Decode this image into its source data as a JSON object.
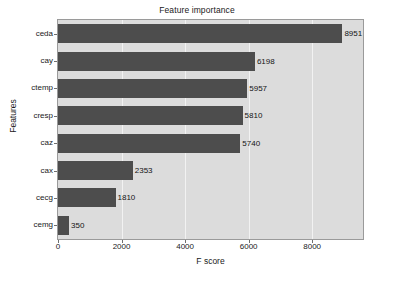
{
  "chart_data": {
    "type": "bar",
    "orientation": "horizontal",
    "title": "Feature importance",
    "xlabel": "F score",
    "ylabel": "Features",
    "categories": [
      "ceda",
      "cay",
      "ctemp",
      "cresp",
      "caz",
      "cax",
      "cecg",
      "cemg"
    ],
    "values": [
      8951,
      6198,
      5957,
      5810,
      5740,
      2353,
      1810,
      350
    ],
    "value_labels": [
      "8951",
      "6198",
      "5957",
      "5810",
      "5740",
      "2353",
      "1810",
      "350"
    ],
    "xlim": [
      0,
      9600
    ],
    "xticks": [
      0,
      2000,
      4000,
      6000,
      8000
    ],
    "xtick_labels": [
      "0",
      "2000",
      "4000",
      "6000",
      "8000"
    ],
    "grid": true,
    "grid_axis": "x",
    "legend": false,
    "bar_color": "#4d4d4d",
    "plot_background": "#dcdcdc",
    "grid_color": "#f2f2f2",
    "figure_background": "#ffffff"
  }
}
